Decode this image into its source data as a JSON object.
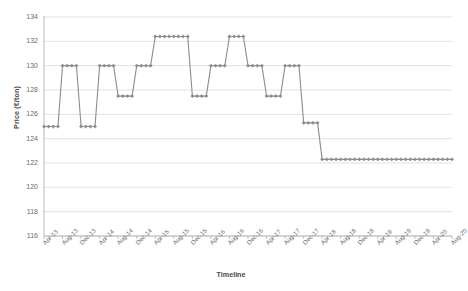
{
  "chart_data": {
    "type": "line",
    "title": "",
    "subtitle": "",
    "xlabel": "Timeline",
    "ylabel": "Price (€/ton)",
    "ylim": [
      116,
      134
    ],
    "ytick_values": [
      116,
      118,
      120,
      122,
      124,
      126,
      128,
      130,
      132,
      134
    ],
    "ytick_labels": [
      "116",
      "118",
      "120",
      "122",
      "124",
      "126",
      "128",
      "130",
      "132",
      "134"
    ],
    "grid": "horizontal",
    "legend": "none",
    "marker": "diamond",
    "line_color": "#8c8c8c",
    "marker_color": "#8c8c8c",
    "grid_color": "#d9d9d9",
    "axis_color": "#b0b0b0",
    "x_tick_interval_months": 4,
    "xtick_labels": [
      "Apr-13",
      "Aug-13",
      "Dec-13",
      "Apr-14",
      "Aug-14",
      "Dec-14",
      "Apr-15",
      "Aug-15",
      "Dec-15",
      "Apr-16",
      "Aug-16",
      "Dec-16",
      "Apr-17",
      "Aug-17",
      "Dec-17",
      "Apr-18",
      "Aug-18",
      "Dec-18",
      "Apr-19",
      "Aug-19",
      "Dec-19",
      "Apr-20",
      "Aug-20"
    ],
    "x": [
      "Apr-13",
      "May-13",
      "Jun-13",
      "Jul-13",
      "Aug-13",
      "Sep-13",
      "Oct-13",
      "Nov-13",
      "Dec-13",
      "Jan-14",
      "Feb-14",
      "Mar-14",
      "Apr-14",
      "May-14",
      "Jun-14",
      "Jul-14",
      "Aug-14",
      "Sep-14",
      "Oct-14",
      "Nov-14",
      "Dec-14",
      "Jan-15",
      "Feb-15",
      "Mar-15",
      "Apr-15",
      "May-15",
      "Jun-15",
      "Jul-15",
      "Aug-15",
      "Sep-15",
      "Oct-15",
      "Nov-15",
      "Dec-15",
      "Jan-16",
      "Feb-16",
      "Mar-16",
      "Apr-16",
      "May-16",
      "Jun-16",
      "Jul-16",
      "Aug-16",
      "Sep-16",
      "Oct-16",
      "Nov-16",
      "Dec-16",
      "Jan-17",
      "Feb-17",
      "Mar-17",
      "Apr-17",
      "May-17",
      "Jun-17",
      "Jul-17",
      "Aug-17",
      "Sep-17",
      "Oct-17",
      "Nov-17",
      "Dec-17",
      "Jan-18",
      "Feb-18",
      "Mar-18",
      "Apr-18",
      "May-18",
      "Jun-18",
      "Jul-18",
      "Aug-18",
      "Sep-18",
      "Oct-18",
      "Nov-18",
      "Dec-18",
      "Jan-19",
      "Feb-19",
      "Mar-19",
      "Apr-19",
      "May-19",
      "Jun-19",
      "Jul-19",
      "Aug-19",
      "Sep-19",
      "Oct-19",
      "Nov-19",
      "Dec-19",
      "Jan-20",
      "Feb-20",
      "Mar-20",
      "Apr-20",
      "May-20",
      "Jun-20",
      "Jul-20",
      "Aug-20"
    ],
    "values": [
      125.0,
      125.0,
      125.0,
      125.0,
      130.0,
      130.0,
      130.0,
      130.0,
      125.0,
      125.0,
      125.0,
      125.0,
      130.0,
      130.0,
      130.0,
      130.0,
      127.5,
      127.5,
      127.5,
      127.5,
      130.0,
      130.0,
      130.0,
      130.0,
      132.4,
      132.4,
      132.4,
      132.4,
      132.4,
      132.4,
      132.4,
      132.4,
      127.5,
      127.5,
      127.5,
      127.5,
      130.0,
      130.0,
      130.0,
      130.0,
      132.4,
      132.4,
      132.4,
      132.4,
      130.0,
      130.0,
      130.0,
      130.0,
      127.5,
      127.5,
      127.5,
      127.5,
      130.0,
      130.0,
      130.0,
      130.0,
      125.3,
      125.3,
      125.3,
      125.3,
      122.3,
      122.3,
      122.3,
      122.3,
      122.3,
      122.3,
      122.3,
      122.3,
      122.3,
      122.3,
      122.3,
      122.3,
      122.3,
      122.3,
      122.3,
      122.3,
      122.3,
      122.3,
      122.3,
      122.3,
      122.3,
      122.3,
      122.3,
      122.3,
      122.3,
      122.3,
      122.3,
      122.3,
      122.3
    ],
    "series": [
      {
        "name": "Price",
        "values": [
          125.0,
          125.0,
          125.0,
          125.0,
          130.0,
          130.0,
          130.0,
          130.0,
          125.0,
          125.0,
          125.0,
          125.0,
          130.0,
          130.0,
          130.0,
          130.0,
          127.5,
          127.5,
          127.5,
          127.5,
          130.0,
          130.0,
          130.0,
          130.0,
          132.4,
          132.4,
          132.4,
          132.4,
          132.4,
          132.4,
          132.4,
          132.4,
          127.5,
          127.5,
          127.5,
          127.5,
          130.0,
          130.0,
          130.0,
          130.0,
          132.4,
          132.4,
          132.4,
          132.4,
          130.0,
          130.0,
          130.0,
          130.0,
          127.5,
          127.5,
          127.5,
          127.5,
          130.0,
          130.0,
          130.0,
          130.0,
          125.3,
          125.3,
          125.3,
          125.3,
          122.3,
          122.3,
          122.3,
          122.3,
          122.3,
          122.3,
          122.3,
          122.3,
          122.3,
          122.3,
          122.3,
          122.3,
          122.3,
          122.3,
          122.3,
          122.3,
          122.3,
          122.3,
          122.3,
          122.3,
          122.3,
          122.3,
          122.3,
          122.3,
          122.3,
          122.3,
          122.3,
          122.3,
          122.3
        ]
      }
    ]
  }
}
